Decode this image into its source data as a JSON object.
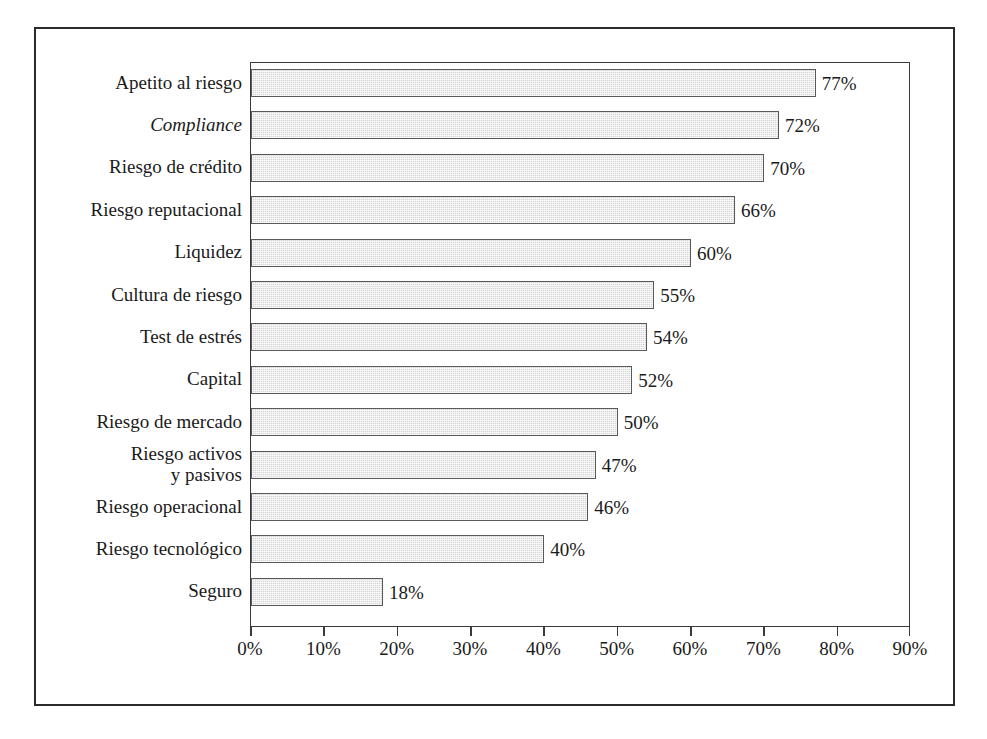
{
  "chart_data": {
    "type": "bar",
    "orientation": "horizontal",
    "title": "",
    "xlabel": "",
    "ylabel": "",
    "xlim": [
      0,
      90
    ],
    "xtick_labels": [
      "0%",
      "10%",
      "20%",
      "30%",
      "40%",
      "50%",
      "60%",
      "70%",
      "80%",
      "90%"
    ],
    "xticks": [
      0,
      10,
      20,
      30,
      40,
      50,
      60,
      70,
      80,
      90
    ],
    "grid": false,
    "legend": null,
    "value_suffix": "%",
    "categories": [
      "Apetito al riesgo",
      "Compliance",
      "Riesgo de crédito",
      "Riesgo reputacional",
      "Liquidez",
      "Cultura de riesgo",
      "Test de estrés",
      "Capital",
      "Riesgo de mercado",
      "Riesgo activos\ny pasivos",
      "Riesgo operacional",
      "Riesgo tecnológico",
      "Seguro"
    ],
    "category_styles": [
      "normal",
      "italic",
      "normal",
      "normal",
      "normal",
      "normal",
      "normal",
      "normal",
      "normal",
      "normal",
      "normal",
      "normal",
      "normal"
    ],
    "values": [
      77,
      72,
      70,
      66,
      60,
      55,
      54,
      52,
      50,
      47,
      46,
      40,
      18
    ],
    "value_labels": [
      "77%",
      "72%",
      "70%",
      "66%",
      "60%",
      "55%",
      "54%",
      "52%",
      "50%",
      "47%",
      "46%",
      "40%",
      "18%"
    ],
    "colors": {
      "bar_fill": "#d4d4d4",
      "bar_border": "#595959",
      "axis": "#3a3a3a",
      "frame": "#2b2b2b",
      "text": "#1a1a1a",
      "background": "#ffffff"
    }
  },
  "caption": {
    "text": "",
    "note": "clipped"
  }
}
